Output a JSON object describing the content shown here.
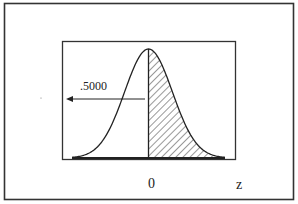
{
  "chart_data": {
    "type": "area",
    "title": "",
    "distribution": "standard normal",
    "xlabel": "z",
    "ylabel": "",
    "x_ticks": [
      "0"
    ],
    "xlim": [
      -3.2,
      3.2
    ],
    "mean": 0,
    "sd": 1,
    "shaded_region": {
      "from": 0,
      "to": "infinity",
      "pattern": "diagonal hatch"
    },
    "annotations": [
      {
        "text": ".5000",
        "arrow": "pointing left",
        "refers_to": "area left of z = 0"
      }
    ],
    "grid": false,
    "legend": "none"
  },
  "labels": {
    "area_value": ".5000",
    "zero_tick": "0",
    "axis_name": "z"
  },
  "colors": {
    "ink": "#222222",
    "background": "#ffffff"
  }
}
